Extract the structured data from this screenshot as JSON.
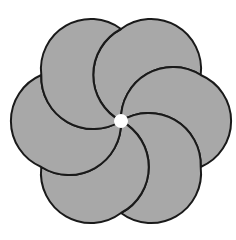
{
  "figure": {
    "petal_count": 6,
    "fill_color": "#a8a8a8",
    "stroke_color": "#1a1a1a",
    "background": "#ffffff"
  }
}
